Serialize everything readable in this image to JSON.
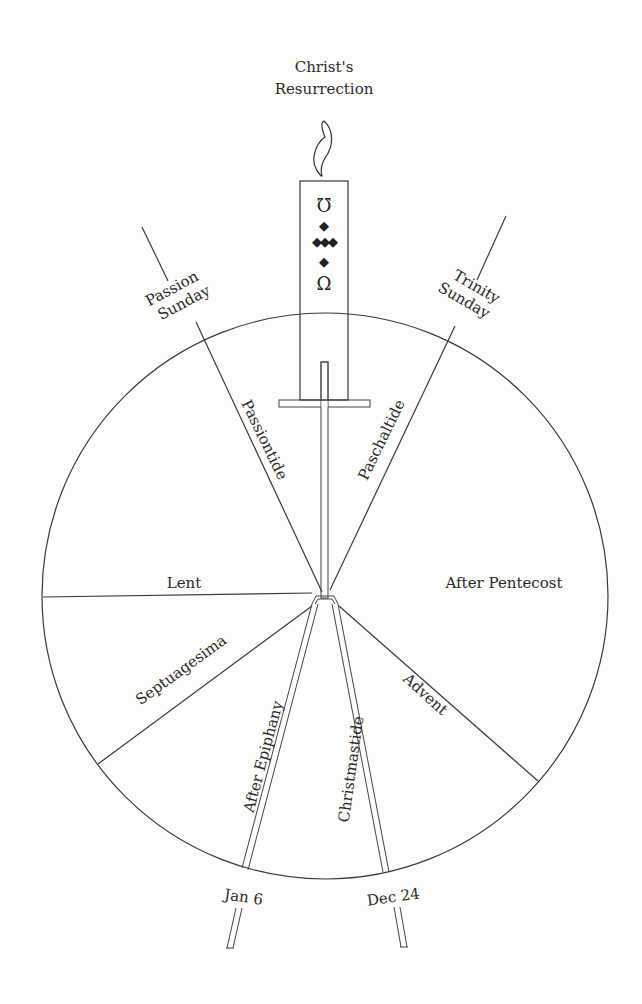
{
  "diagram": {
    "title": [
      "Christ's",
      "Resurrection"
    ],
    "candle": {
      "top_symbol": "Ω",
      "bottom_symbol": "Ω",
      "diamonds": [
        "◆",
        "◆◆◆",
        "◆"
      ]
    },
    "boundary_labels": {
      "passion_sunday": [
        "Passion",
        "Sunday"
      ],
      "trinity_sunday": [
        "Trinity",
        "Sunday"
      ],
      "jan6": "Jan 6",
      "dec24": "Dec 24"
    },
    "seasons": {
      "passiontide": "Passiontide",
      "paschaltide": "Paschaltide",
      "lent": "Lent",
      "after_pentecost": "After Pentecost",
      "septuagesima": "Septuagesima",
      "after_epiphany": "After Epiphany",
      "christmastide": "Christmastide",
      "advent": "Advent"
    },
    "colors": {
      "ink": "#2a2a2a",
      "paper": "#fdfdfc"
    }
  }
}
